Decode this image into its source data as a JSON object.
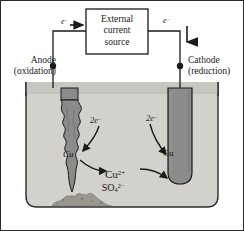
{
  "figure": {
    "background_color": "#ffffff",
    "border_color": "#2b2b2b"
  },
  "power_source": {
    "line1": "External",
    "line2": "current",
    "line3": "source",
    "box_fill": "#ffffff",
    "box_stroke": "#1a1a1a"
  },
  "electrodes": {
    "anode": {
      "name": "Anode",
      "process": "(oxidation)",
      "material_label": "Cu",
      "fill": "#8b8b8b",
      "stroke": "#1a1a1a"
    },
    "cathode": {
      "name": "Cathode",
      "process": "(reduction)",
      "material_label": "Cu",
      "fill": "#8b8b8b",
      "stroke": "#1a1a1a"
    }
  },
  "annotations": {
    "electron_left": "e",
    "electron_left_charge": "−",
    "electron_right": "e",
    "electron_right_charge": "−",
    "two_electrons_left": "2e",
    "two_electrons_left_charge": "−",
    "two_electrons_right": "2e",
    "two_electrons_right_charge": "−"
  },
  "solution": {
    "cation_symbol": "Cu",
    "cation_charge": "2+",
    "anion_symbol": "SO",
    "anion_subscript": "4",
    "anion_charge": "2−",
    "fill": "#d3d1cc",
    "beaker_stroke": "#2b2b2b",
    "sediment_color": "#9a978f"
  }
}
